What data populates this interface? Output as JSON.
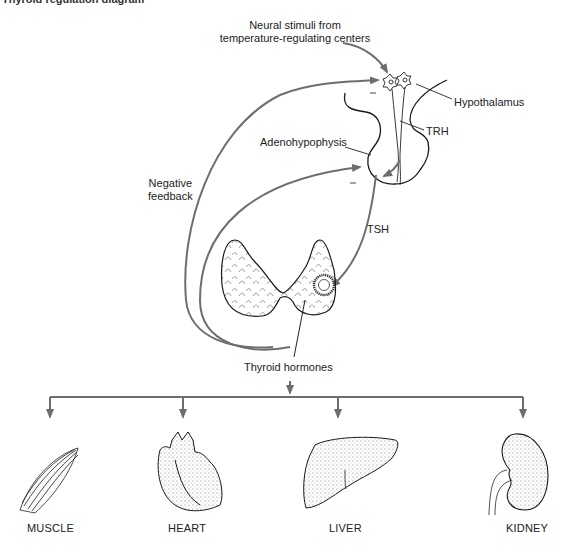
{
  "figure": {
    "cropped_caption": "Thyroid regulation diagram"
  },
  "labels": {
    "neural_stimuli_line1": "Neural stimuli from",
    "neural_stimuli_line2": "temperature-regulating centers",
    "hypothalamus": "Hypothalamus",
    "trh": "TRH",
    "adenohypophysis": "Adenohypophysis",
    "negative_feedback_line1": "Negative",
    "negative_feedback_line2": "feedback",
    "tsh": "TSH",
    "thyroid_hormones": "Thyroid hormones",
    "minus_sign": "–"
  },
  "targets": [
    {
      "label": "MUSCLE"
    },
    {
      "label": "HEART"
    },
    {
      "label": "LIVER"
    },
    {
      "label": "KIDNEY"
    }
  ],
  "colors": {
    "arrow": "#6e6e6e",
    "outline": "#1a1a1a",
    "text": "#222222"
  }
}
